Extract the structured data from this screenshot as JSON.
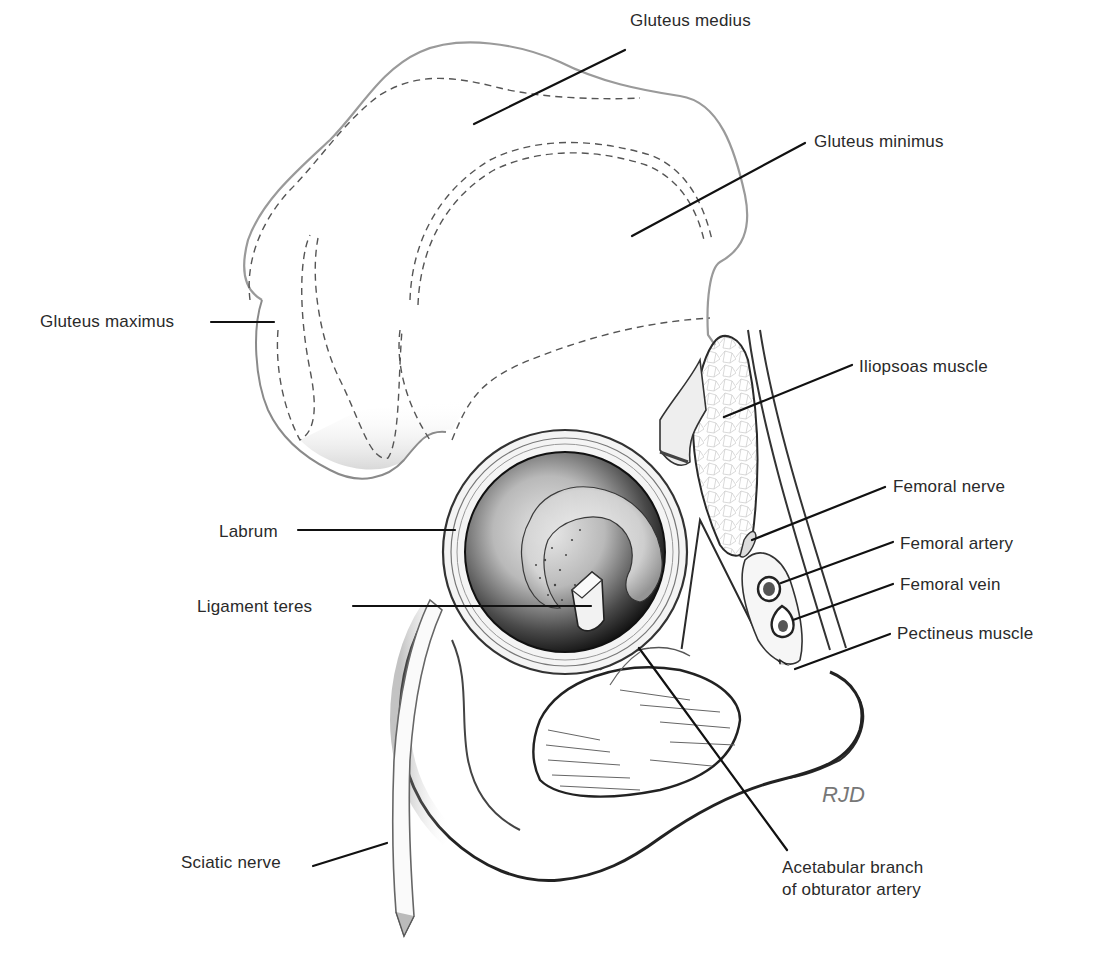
{
  "figure": {
    "signature": "RJD",
    "colors": {
      "background": "#ffffff",
      "ink": "#1a1a1a",
      "label_text": "#2a2a2a",
      "leader": "#111111",
      "dashed_outline": "#555555",
      "socket_dark": "#1e1e1e"
    }
  },
  "labels": [
    {
      "id": "gluteus-medius",
      "text": "Gluteus medius",
      "x": 630,
      "y": 10,
      "line": [
        [
          625,
          50
        ],
        [
          474,
          124
        ]
      ]
    },
    {
      "id": "gluteus-minimus",
      "text": "Gluteus minimus",
      "x": 814,
      "y": 131,
      "line": [
        [
          805,
          143
        ],
        [
          632,
          236
        ]
      ]
    },
    {
      "id": "gluteus-maximus",
      "text": "Gluteus maximus",
      "x": 40,
      "y": 311,
      "line": [
        [
          211,
          322
        ],
        [
          274,
          322
        ]
      ]
    },
    {
      "id": "iliopsoas-muscle",
      "text": "Iliopsoas muscle",
      "x": 859,
      "y": 356,
      "line": [
        [
          852,
          365
        ],
        [
          724,
          417
        ]
      ]
    },
    {
      "id": "femoral-nerve",
      "text": "Femoral nerve",
      "x": 893,
      "y": 476,
      "line": [
        [
          885,
          487
        ],
        [
          752,
          540
        ]
      ]
    },
    {
      "id": "labrum",
      "text": "Labrum",
      "x": 219,
      "y": 521,
      "line": [
        [
          298,
          530
        ],
        [
          455,
          530
        ]
      ]
    },
    {
      "id": "femoral-artery",
      "text": "Femoral artery",
      "x": 900,
      "y": 533,
      "line": [
        [
          893,
          542
        ],
        [
          781,
          583
        ]
      ]
    },
    {
      "id": "femoral-vein",
      "text": "Femoral vein",
      "x": 900,
      "y": 574,
      "line": [
        [
          893,
          584
        ],
        [
          793,
          620
        ]
      ]
    },
    {
      "id": "ligament-teres",
      "text": "Ligament teres",
      "x": 197,
      "y": 596,
      "line": [
        [
          353,
          606
        ],
        [
          591,
          606
        ]
      ]
    },
    {
      "id": "pectineus-muscle",
      "text": "Pectineus muscle",
      "x": 897,
      "y": 623,
      "line": [
        [
          890,
          634
        ],
        [
          795,
          669
        ]
      ]
    },
    {
      "id": "sciatic-nerve",
      "text": "Sciatic nerve",
      "x": 181,
      "y": 852,
      "line": [
        [
          313,
          866
        ],
        [
          387,
          843
        ]
      ]
    },
    {
      "id": "acetabular-branch",
      "text": "Acetabular branch\nof obturator artery",
      "x": 782,
      "y": 857,
      "line": [
        [
          639,
          648
        ],
        [
          787,
          850
        ]
      ]
    }
  ]
}
